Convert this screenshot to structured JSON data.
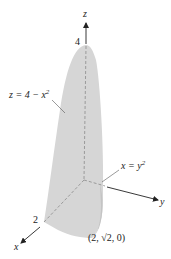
{
  "figure": {
    "axes": {
      "x_label": "x",
      "y_label": "y",
      "z_label": "z",
      "z_tick": "4",
      "x_tick": "2"
    },
    "surfaces": {
      "parabolic_cylinder_label_lhs": "z = 4 − x",
      "parabolic_cylinder_exp": "2",
      "base_curve_label_lhs": "x = y",
      "base_curve_exp": "2"
    },
    "point_label": "(2, √2, 0)",
    "colors": {
      "surface_fill": "#d6d6d6",
      "surface_side": "#c4c4c4",
      "axis": "#222222",
      "dashed": "#8a8a8a"
    }
  }
}
